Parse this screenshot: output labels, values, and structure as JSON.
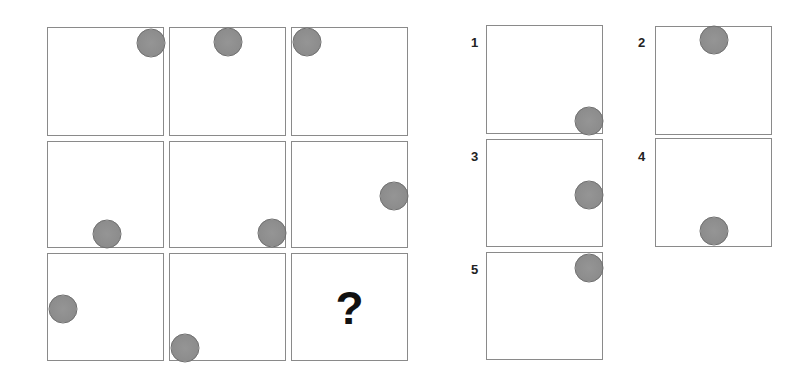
{
  "puzzle": {
    "matrix": {
      "rows": 3,
      "cols": 3,
      "cells": [
        {
          "row": 1,
          "col": 1,
          "box": [
            47,
            27,
            117,
            109
          ],
          "ball": [
            103,
            15
          ],
          "text": ""
        },
        {
          "row": 1,
          "col": 2,
          "box": [
            169,
            27,
            117,
            109
          ],
          "ball": [
            58,
            14
          ],
          "text": ""
        },
        {
          "row": 1,
          "col": 3,
          "box": [
            291,
            27,
            117,
            109
          ],
          "ball": [
            15,
            14
          ],
          "text": ""
        },
        {
          "row": 2,
          "col": 1,
          "box": [
            47,
            141,
            117,
            107
          ],
          "ball": [
            59,
            92
          ],
          "text": ""
        },
        {
          "row": 2,
          "col": 2,
          "box": [
            169,
            141,
            117,
            107
          ],
          "ball": [
            102,
            91
          ],
          "text": ""
        },
        {
          "row": 2,
          "col": 3,
          "box": [
            291,
            141,
            117,
            107
          ],
          "ball": [
            102,
            54
          ],
          "text": ""
        },
        {
          "row": 3,
          "col": 1,
          "box": [
            47,
            253,
            117,
            108
          ],
          "ball": [
            15,
            55
          ],
          "text": ""
        },
        {
          "row": 3,
          "col": 2,
          "box": [
            169,
            253,
            117,
            108
          ],
          "ball": [
            15,
            94
          ],
          "text": ""
        },
        {
          "row": 3,
          "col": 3,
          "box": [
            291,
            253,
            117,
            108
          ],
          "ball": null,
          "text": "?"
        }
      ]
    },
    "options": [
      {
        "label": "1",
        "label_pos": [
          471,
          36
        ],
        "box": [
          486,
          25,
          117,
          109
        ],
        "ball": [
          102,
          95
        ]
      },
      {
        "label": "2",
        "label_pos": [
          638,
          36
        ],
        "box": [
          655,
          26,
          117,
          109
        ],
        "ball": [
          58,
          13
        ]
      },
      {
        "label": "3",
        "label_pos": [
          471,
          150
        ],
        "box": [
          486,
          139,
          117,
          108
        ],
        "ball": [
          102,
          55
        ]
      },
      {
        "label": "4",
        "label_pos": [
          638,
          150
        ],
        "box": [
          655,
          138,
          117,
          109
        ],
        "ball": [
          58,
          92
        ]
      },
      {
        "label": "5",
        "label_pos": [
          471,
          263
        ],
        "box": [
          486,
          252,
          117,
          108
        ],
        "ball": [
          102,
          15
        ]
      }
    ],
    "colors": {
      "border": "#8a8a8a",
      "ball_fill": "#8f8f8f",
      "ball_outline": "#6e6e6e",
      "text": "#111111"
    }
  }
}
